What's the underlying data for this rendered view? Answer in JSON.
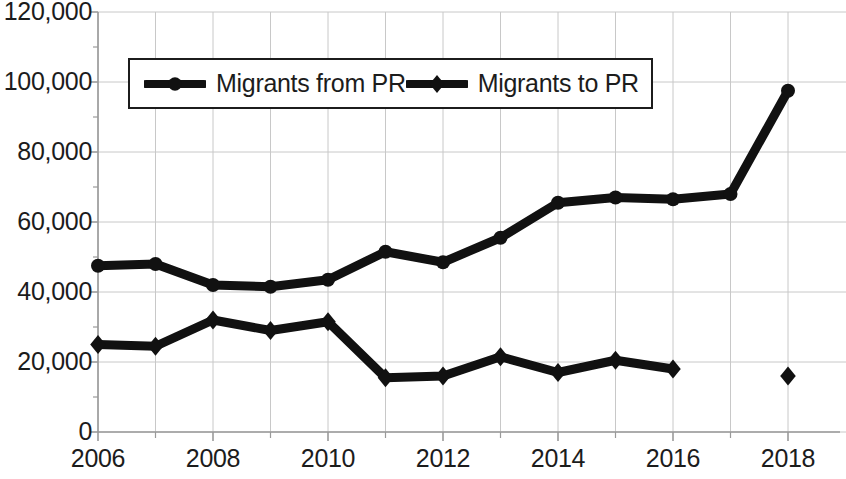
{
  "chart_data": {
    "type": "line",
    "title": "",
    "xlabel": "",
    "ylabel": "",
    "x": [
      2006,
      2007,
      2008,
      2009,
      2010,
      2011,
      2012,
      2013,
      2014,
      2015,
      2016,
      2017,
      2018
    ],
    "xlim": [
      2006,
      2018
    ],
    "ylim": [
      0,
      120000
    ],
    "ytick_values": [
      0,
      20000,
      40000,
      60000,
      80000,
      100000,
      120000
    ],
    "ytick_labels": [
      "0",
      "20,000",
      "40,000",
      "60,000",
      "80,000",
      "100,000",
      "120,000"
    ],
    "xtick_values": [
      2006,
      2008,
      2010,
      2012,
      2014,
      2016,
      2018
    ],
    "xtick_labels": [
      "2006",
      "2008",
      "2010",
      "2012",
      "2014",
      "2016",
      "2018"
    ],
    "minor_xticks": [
      2007,
      2009,
      2011,
      2013,
      2015,
      2017
    ],
    "minor_yticks": [
      10000,
      30000,
      50000,
      70000,
      90000,
      110000
    ],
    "grid": "both",
    "legend_position": "top-center",
    "series": [
      {
        "name": "Migrants from PR",
        "marker": "circle",
        "color": "#111111",
        "values": [
          47500,
          48000,
          42000,
          41500,
          43500,
          51500,
          48500,
          55500,
          65500,
          67000,
          66500,
          68000,
          97500
        ],
        "x": [
          2006,
          2007,
          2008,
          2009,
          2010,
          2011,
          2012,
          2013,
          2014,
          2015,
          2016,
          2017,
          2018
        ],
        "connected": true
      },
      {
        "name": "Migrants to PR",
        "marker": "diamond",
        "color": "#111111",
        "values": [
          25000,
          24500,
          32000,
          29000,
          31500,
          15500,
          16000,
          21500,
          17000,
          20500,
          18000,
          null,
          16000
        ],
        "x": [
          2006,
          2007,
          2008,
          2009,
          2010,
          2011,
          2012,
          2013,
          2014,
          2015,
          2016,
          2017,
          2018
        ],
        "connected_through": 2016,
        "isolated_points": [
          {
            "x": 2018,
            "y": 16000
          }
        ]
      }
    ]
  },
  "legend": {
    "entries": [
      {
        "label": "Migrants from PR",
        "marker": "circle"
      },
      {
        "label": "Migrants to PR",
        "marker": "diamond"
      }
    ]
  },
  "colors": {
    "series": "#111111",
    "grid": "#c8c8c8",
    "axis": "#9a9a9a",
    "text": "#1c1c1c",
    "background": "#ffffff"
  }
}
